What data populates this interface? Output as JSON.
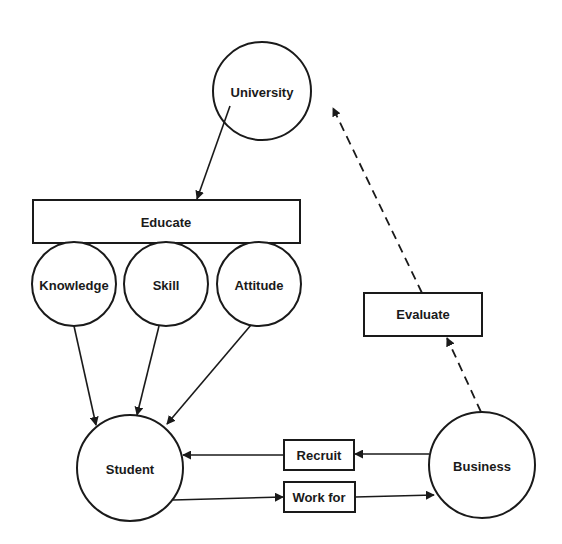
{
  "diagram": {
    "colors": {
      "stroke": "#1a1a1a",
      "background": "#ffffff"
    },
    "nodes": {
      "university": {
        "label": "University",
        "shape": "circle"
      },
      "educate": {
        "label": "Educate",
        "shape": "rectangle"
      },
      "knowledge": {
        "label": "Knowledge",
        "shape": "circle"
      },
      "skill": {
        "label": "Skill",
        "shape": "circle"
      },
      "attitude": {
        "label": "Attitude",
        "shape": "circle"
      },
      "student": {
        "label": "Student",
        "shape": "circle"
      },
      "business": {
        "label": "Business",
        "shape": "circle"
      },
      "evaluate": {
        "label": "Evaluate",
        "shape": "rectangle"
      },
      "recruit": {
        "label": "Recruit",
        "shape": "rectangle"
      },
      "work_for": {
        "label": "Work for",
        "shape": "rectangle"
      }
    },
    "edges": [
      {
        "from": "University",
        "to": "Educate",
        "style": "solid"
      },
      {
        "from": "Knowledge",
        "to": "Student",
        "style": "solid"
      },
      {
        "from": "Skill",
        "to": "Student",
        "style": "solid"
      },
      {
        "from": "Attitude",
        "to": "Student",
        "style": "solid"
      },
      {
        "from": "Business",
        "via": "Recruit",
        "to": "Student",
        "style": "solid"
      },
      {
        "from": "Student",
        "via": "Work for",
        "to": "Business",
        "style": "solid"
      },
      {
        "from": "Business",
        "via": "Evaluate",
        "to": "University",
        "style": "dashed"
      }
    ]
  }
}
